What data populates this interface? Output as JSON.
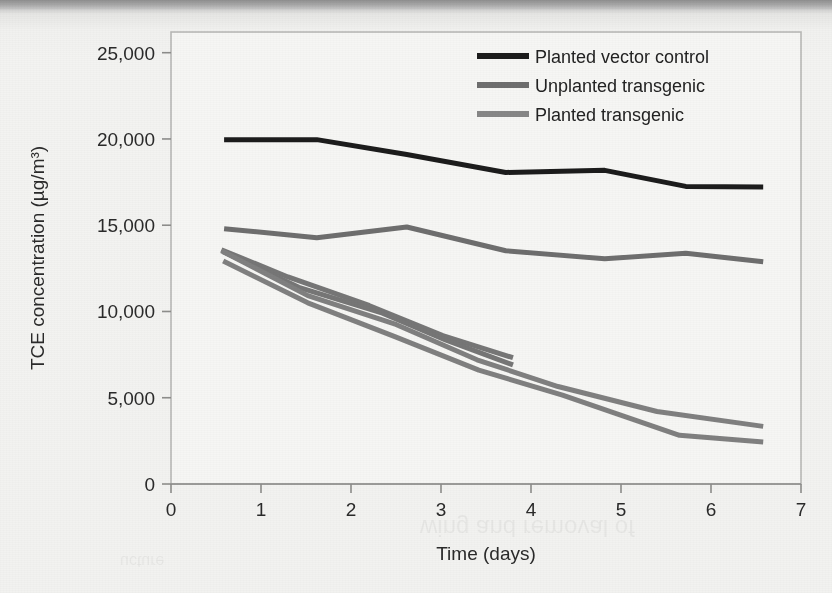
{
  "page": {
    "background_color": "#f2f2f0",
    "scan_edge_color": "#8f8f8f"
  },
  "chart_data": {
    "type": "line",
    "title": "",
    "xlabel": "Time (days)",
    "ylabel": "TCE concentration (µg/m³)",
    "xlim": [
      0,
      7
    ],
    "ylim": [
      0,
      26200
    ],
    "xticks": [
      0,
      1,
      2,
      3,
      4,
      5,
      6,
      7
    ],
    "xtick_labels": [
      "0",
      "1",
      "2",
      "3",
      "4",
      "5",
      "6",
      "7"
    ],
    "yticks": [
      0,
      5000,
      10000,
      15000,
      20000,
      25000
    ],
    "ytick_labels": [
      "0",
      "5,000",
      "10,000",
      "15,000",
      "20,000",
      "25,000"
    ],
    "grid": false,
    "legend_position": "top-right",
    "frame": true,
    "series": [
      {
        "name": "Planted vector control",
        "color": "#1c1c1c",
        "width": 5,
        "points": [
          [
            0.59,
            19950
          ],
          [
            1.62,
            19960
          ],
          [
            2.62,
            19100
          ],
          [
            3.72,
            18060
          ],
          [
            4.82,
            18180
          ],
          [
            5.72,
            17250
          ],
          [
            6.58,
            17220
          ]
        ]
      },
      {
        "name": "Unplanted transgenic",
        "color": "#6e6e6e",
        "width": 5,
        "points": [
          [
            0.59,
            14800
          ],
          [
            1.62,
            14280
          ],
          [
            2.62,
            14900
          ],
          [
            3.72,
            13520
          ],
          [
            4.82,
            13050
          ],
          [
            5.72,
            13380
          ],
          [
            6.58,
            12880
          ]
        ]
      },
      {
        "name": "Unplanted transgenic replicate a",
        "color": "#767676",
        "width": 5,
        "points": [
          [
            0.56,
            13580
          ],
          [
            1.3,
            12000
          ],
          [
            2.2,
            10350
          ],
          [
            3.02,
            8600
          ],
          [
            3.8,
            7320
          ]
        ]
      },
      {
        "name": "Unplanted transgenic replicate b",
        "color": "#767676",
        "width": 5,
        "points": [
          [
            0.58,
            13460
          ],
          [
            1.42,
            11400
          ],
          [
            2.35,
            9900
          ],
          [
            3.05,
            8350
          ],
          [
            3.8,
            6900
          ]
        ]
      },
      {
        "name": "Planted transgenic",
        "color": "#808080",
        "width": 5,
        "points": [
          [
            0.56,
            13520
          ],
          [
            1.52,
            10920
          ],
          [
            2.5,
            9250
          ],
          [
            3.4,
            7200
          ],
          [
            4.3,
            5650
          ],
          [
            5.4,
            4200
          ],
          [
            6.58,
            3340
          ]
        ]
      },
      {
        "name": "Planted transgenic replicate",
        "color": "#808080",
        "width": 5,
        "points": [
          [
            0.58,
            12930
          ],
          [
            1.52,
            10500
          ],
          [
            2.48,
            8560
          ],
          [
            3.42,
            6600
          ],
          [
            4.35,
            5150
          ],
          [
            5.65,
            2820
          ],
          [
            6.58,
            2440
          ]
        ]
      }
    ],
    "legend": [
      {
        "label": "Planted vector control",
        "color": "#1c1c1c"
      },
      {
        "label": "Unplanted transgenic",
        "color": "#6e6e6e"
      },
      {
        "label": "Planted transgenic",
        "color": "#878787"
      }
    ]
  }
}
